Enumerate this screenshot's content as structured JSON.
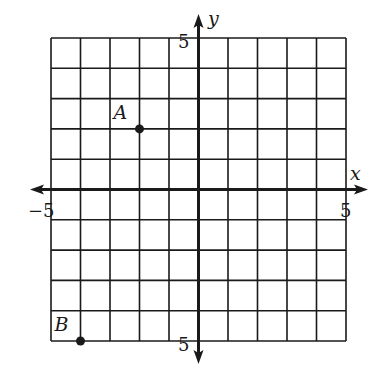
{
  "chart_data": {
    "type": "scatter",
    "title": "",
    "xlabel": "x",
    "ylabel": "y",
    "xlim": [
      -5,
      5
    ],
    "ylim": [
      -5,
      5
    ],
    "grid": true,
    "grid_step": 1,
    "tick_labels": {
      "x_left": "−5",
      "x_right": "5",
      "y_top": "5",
      "y_bottom": "5"
    },
    "points": [
      {
        "label": "A",
        "x": -2,
        "y": 2
      },
      {
        "label": "B",
        "x": -4,
        "y": -5
      }
    ]
  },
  "colors": {
    "ink": "#1a1a1a",
    "background": "#ffffff"
  }
}
